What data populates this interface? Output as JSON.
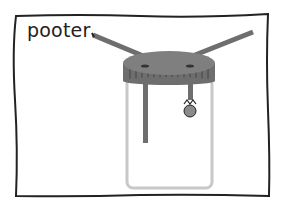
{
  "diagram": {
    "title": "pooter",
    "parts": [
      "jar",
      "lid",
      "mouthpiece-tube",
      "intake-tube",
      "gauze-filter",
      "insect"
    ]
  },
  "colors": {
    "outline": "#222222",
    "tube": "#6e6e6e",
    "lid": "#7a7a7a",
    "jar": "#c8c8c8"
  }
}
